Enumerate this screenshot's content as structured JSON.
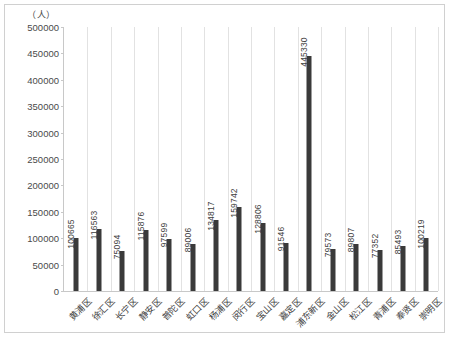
{
  "chart_data": {
    "type": "bar",
    "title": "",
    "subtitle": "",
    "xlabel": "",
    "ylabel": "",
    "unit_caption": "（人）",
    "ylim": [
      0,
      500000
    ],
    "ytick_step": 50000,
    "yticks": [
      "0",
      "50000",
      "100000",
      "150000",
      "200000",
      "250000",
      "300000",
      "350000",
      "400000",
      "450000",
      "500000"
    ],
    "grid": "vertical-category-separators",
    "legend": "none",
    "bar_color": "#3a3a3a",
    "categories": [
      "黄浦区",
      "徐汇区",
      "长宁区",
      "静安区",
      "普陀区",
      "虹口区",
      "杨浦区",
      "闵行区",
      "宝山区",
      "嘉定区",
      "浦东新区",
      "金山区",
      "松江区",
      "青浦区",
      "奉贤区",
      "崇明区"
    ],
    "values": [
      100665,
      116563,
      75094,
      115876,
      97599,
      89006,
      134817,
      159742,
      128806,
      91546,
      445330,
      79573,
      89807,
      77352,
      85493,
      100219
    ],
    "value_labels": [
      "100665",
      "116563",
      "75094",
      "115876",
      "97599",
      "89006",
      "134817",
      "159742",
      "128806",
      "91546",
      "445330",
      "79573",
      "89807",
      "77352",
      "85493",
      "100219"
    ]
  }
}
